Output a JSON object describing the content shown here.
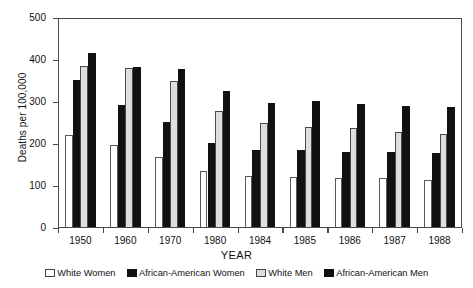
{
  "chart_data": {
    "type": "bar",
    "title": "",
    "xlabel": "YEAR",
    "ylabel": "Deaths per 100,000",
    "categories": [
      "1950",
      "1960",
      "1970",
      "1980",
      "1984",
      "1985",
      "1986",
      "1987",
      "1988"
    ],
    "ylim": [
      0,
      500
    ],
    "yticks": [
      0,
      100,
      200,
      300,
      400,
      500
    ],
    "grid": false,
    "legend_position": "bottom",
    "series": [
      {
        "name": "White Women",
        "color": "#ffffff",
        "values": [
          222,
          198,
          170,
          135,
          123,
          122,
          120,
          118,
          115
        ]
      },
      {
        "name": "African-American Women",
        "color": "#111111",
        "values": [
          352,
          293,
          252,
          202,
          186,
          186,
          182,
          180,
          178
        ]
      },
      {
        "name": "White Men",
        "color": "#dedede",
        "values": [
          385,
          382,
          350,
          278,
          250,
          240,
          238,
          228,
          225
        ]
      },
      {
        "name": "African-American Men",
        "color": "#111111",
        "values": [
          417,
          384,
          378,
          327,
          298,
          302,
          295,
          290,
          287
        ]
      }
    ]
  },
  "axis": {
    "y_tick_labels": [
      "500",
      "400",
      "300",
      "200",
      "100",
      "0"
    ],
    "x_tick_labels": [
      "1950",
      "1960",
      "1970",
      "1980",
      "1984",
      "1985",
      "1986",
      "1987",
      "1988"
    ],
    "y_title": "Deaths per 100,000",
    "x_title": "YEAR"
  },
  "legend": {
    "items": [
      {
        "label": "White Women",
        "style": "white"
      },
      {
        "label": "African-American Women",
        "style": "black"
      },
      {
        "label": "White Men",
        "style": "light"
      },
      {
        "label": "African-American Men",
        "style": "black"
      }
    ]
  }
}
